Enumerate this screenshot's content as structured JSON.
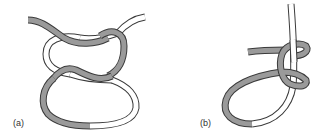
{
  "figure": {
    "panels": [
      {
        "id": "a",
        "label": "(a)",
        "description": "Two interlocked loops — grey and white rope strands twisted around each other forming a knot"
      },
      {
        "id": "b",
        "label": "(b)",
        "description": "Single rope loop with grey strand wrapping twice around a white standing strand"
      }
    ],
    "colors": {
      "grey_strand": "#9a9a9a",
      "white_strand": "#ffffff",
      "outline": "#3a3a3a"
    }
  }
}
